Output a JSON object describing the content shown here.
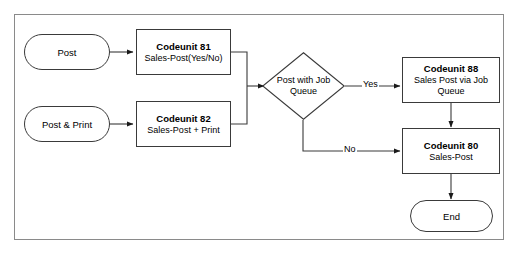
{
  "diagram": {
    "frame": {
      "border_color": "#8a8a8a",
      "background": "#ffffff"
    },
    "line_color": "#3a3a3a",
    "nodes": {
      "post": {
        "label": "Post",
        "shape": "terminator"
      },
      "post_and_print": {
        "label": "Post & Print",
        "shape": "terminator"
      },
      "codeunit81": {
        "title": "Codeunit 81",
        "sub": "Sales-Post(Yes/No)",
        "shape": "process"
      },
      "codeunit82": {
        "title": "Codeunit 82",
        "sub": "Sales-Post + Print",
        "shape": "process"
      },
      "decision": {
        "label": "Post with Job Queue",
        "shape": "decision"
      },
      "codeunit88": {
        "title": "Codeunit 88",
        "sub": "Sales Post via Job Queue",
        "shape": "process"
      },
      "codeunit80": {
        "title": "Codeunit 80",
        "sub": "Sales-Post",
        "shape": "process"
      },
      "end": {
        "label": "End",
        "shape": "terminator"
      }
    },
    "edge_labels": {
      "yes": "Yes",
      "no": "No"
    }
  }
}
